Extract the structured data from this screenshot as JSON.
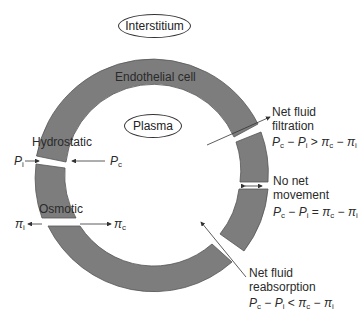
{
  "diagram": {
    "colors": {
      "wall": "#7d7d7d",
      "wall_edge": "#555555",
      "arrow": "#333333",
      "background": "#ffffff"
    },
    "regions": {
      "interstitium": "Interstitium",
      "plasma": "Plasma",
      "wall": "Endothelial cell"
    },
    "forces": {
      "hydrostatic": {
        "label": "Hydrostatic",
        "left": "P",
        "left_sub": "i",
        "right": "P",
        "right_sub": "c"
      },
      "osmotic": {
        "label": "Osmotic",
        "left": "π",
        "left_sub": "i",
        "right": "π",
        "right_sub": "c"
      }
    },
    "outcomes": [
      {
        "id": "filtration",
        "line1": "Net fluid",
        "line2": "filtration",
        "relation": ">"
      },
      {
        "id": "no-net",
        "line1": "No net",
        "line2": "movement",
        "relation": "="
      },
      {
        "id": "reabsorption",
        "line1": "Net fluid",
        "line2": "reabsorption",
        "relation": "<"
      }
    ],
    "equation_terms": {
      "Pc": "P",
      "c": "c",
      "Pi": "P",
      "i": "i",
      "pic": "π",
      "pii": "π",
      "minus": "−"
    }
  }
}
